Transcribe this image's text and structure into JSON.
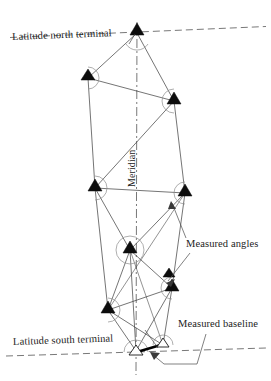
{
  "figure": {
    "type": "diagram",
    "width": 271,
    "height": 381,
    "background": "#ffffff",
    "ink_color": "#1c1c1c"
  },
  "labels": {
    "north_terminal": "Latitude north terminal",
    "south_terminal": "Latitude south terminal",
    "measured_angles": "Measured angles",
    "measured_baseline": "Measured baseline",
    "meridian": "Meridian"
  },
  "legend_markers": {
    "filled_triangle": "triangulation-station-occupied",
    "open_triangle": "triangulation-station-terminal",
    "arc": "measured-angle-arc",
    "thick_segment": "measured-baseline-segment",
    "dashed_horizontal": "parallel-of-latitude",
    "dash_dot_vertical": "meridian-axis"
  },
  "geometry": {
    "meridian": {
      "x": 137,
      "y_top": 22,
      "y_bottom": 375
    },
    "latitude_north": {
      "x1": 10,
      "y1": 37,
      "x2": 266,
      "y2": 27
    },
    "latitude_south": {
      "x1": 6,
      "y1": 356,
      "x2": 266,
      "y2": 348
    },
    "stations": [
      {
        "id": "N",
        "name": "north-terminal-station",
        "x": 137,
        "y": 32,
        "marker": "filled"
      },
      {
        "id": "A",
        "name": "station-upper-left",
        "x": 88,
        "y": 78,
        "marker": "filled"
      },
      {
        "id": "B",
        "name": "station-upper-right",
        "x": 174,
        "y": 101,
        "marker": "filled"
      },
      {
        "id": "C",
        "name": "station-middle-left",
        "x": 95,
        "y": 188,
        "marker": "filled"
      },
      {
        "id": "D",
        "name": "station-middle-right",
        "x": 185,
        "y": 193,
        "marker": "filled"
      },
      {
        "id": "E",
        "name": "station-center",
        "x": 130,
        "y": 250,
        "marker": "filled"
      },
      {
        "id": "F",
        "name": "station-lower-right",
        "x": 172,
        "y": 288,
        "marker": "filled"
      },
      {
        "id": "G",
        "name": "station-lower-left",
        "x": 108,
        "y": 310,
        "marker": "filled"
      },
      {
        "id": "H",
        "name": "station-baseline-east",
        "x": 163,
        "y": 345,
        "marker": "open"
      },
      {
        "id": "S",
        "name": "south-terminal-station",
        "x": 136,
        "y": 352,
        "marker": "open"
      }
    ],
    "network_lines": [
      {
        "from": "N",
        "to": "A"
      },
      {
        "from": "N",
        "to": "B"
      },
      {
        "from": "A",
        "to": "B"
      },
      {
        "from": "A",
        "to": "C"
      },
      {
        "from": "B",
        "to": "C"
      },
      {
        "from": "B",
        "to": "D"
      },
      {
        "from": "C",
        "to": "D"
      },
      {
        "from": "C",
        "to": "E"
      },
      {
        "from": "C",
        "to": "G"
      },
      {
        "from": "D",
        "to": "E"
      },
      {
        "from": "D",
        "to": "F"
      },
      {
        "from": "E",
        "to": "F"
      },
      {
        "from": "E",
        "to": "G"
      },
      {
        "from": "E",
        "to": "S"
      },
      {
        "from": "F",
        "to": "G"
      },
      {
        "from": "F",
        "to": "S"
      },
      {
        "from": "F",
        "to": "H"
      },
      {
        "from": "G",
        "to": "S"
      },
      {
        "from": "G",
        "to": "H"
      },
      {
        "from": "H",
        "to": "S"
      },
      {
        "from": "D",
        "to": "G"
      },
      {
        "from": "E",
        "to": "H"
      }
    ],
    "baseline": {
      "from": "S",
      "to": "H",
      "style": "thick"
    },
    "angle_arcs": [
      {
        "at": "N",
        "r": 11
      },
      {
        "at": "A",
        "r": 11
      },
      {
        "at": "B",
        "r": 12
      },
      {
        "at": "C",
        "r": 12
      },
      {
        "at": "D",
        "r": 11
      },
      {
        "at": "E",
        "r": 14
      },
      {
        "at": "F",
        "r": 11
      },
      {
        "at": "G",
        "r": 12
      },
      {
        "at": "S",
        "r": 12
      }
    ]
  }
}
